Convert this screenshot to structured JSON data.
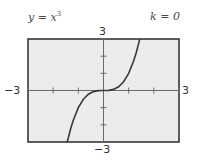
{
  "figure": {
    "equation": {
      "y": "y",
      "eq": " = ",
      "base": "x",
      "exp": "3"
    },
    "parameter": "k = 0",
    "colors": {
      "background": "#ececec",
      "border": "#2a2a2a",
      "axis": "#6a6a6a",
      "curve": "#3a3a3a"
    }
  },
  "chart_data": {
    "type": "line",
    "annotation": "k = 0",
    "xlabel": "",
    "ylabel": "",
    "xlim": [
      -3,
      3
    ],
    "ylim": [
      -3,
      3
    ],
    "xticks": [
      -3,
      -2,
      -1,
      0,
      1,
      2,
      3
    ],
    "yticks": [
      -3,
      -2,
      -1,
      0,
      1,
      2,
      3
    ],
    "tick_labels": {
      "xmin": "−3",
      "xmax": "3",
      "ymin": "−3",
      "ymax": "3"
    },
    "grid": false,
    "series": [
      {
        "name": "y = x^3",
        "function": "x^3",
        "x": [
          -1.44,
          -1.3,
          -1.2,
          -1.0,
          -0.8,
          -0.6,
          -0.4,
          -0.2,
          0,
          0.2,
          0.4,
          0.6,
          0.8,
          1.0,
          1.2,
          1.3,
          1.44
        ],
        "y": [
          -2.99,
          -2.197,
          -1.728,
          -1.0,
          -0.512,
          -0.216,
          -0.064,
          -0.008,
          0,
          0.008,
          0.064,
          0.216,
          0.512,
          1.0,
          1.728,
          2.197,
          2.99
        ]
      }
    ]
  }
}
